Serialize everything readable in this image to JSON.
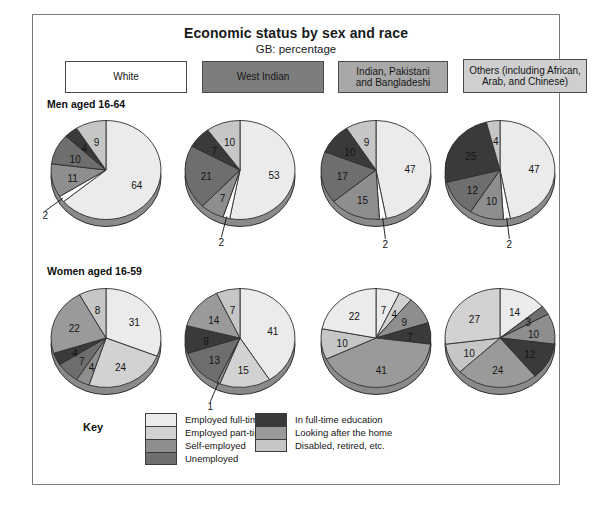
{
  "figure": {
    "title": "Economic status by sex and race",
    "subtitle": "GB: percentage",
    "row_labels": {
      "men": "Men aged 16-64",
      "women": "Women aged 16-59"
    },
    "key_title": "Key"
  },
  "groups": [
    {
      "id": "white",
      "line1": "White",
      "line2": "",
      "swatch": "#ffffff"
    },
    {
      "id": "west-indian",
      "line1": "West Indian",
      "line2": "",
      "swatch": "#7d7d7d"
    },
    {
      "id": "indian-pakistani-bangladeshi",
      "line1": "Indian, Pakistani",
      "line2": "and Bangladeshi",
      "swatch": "#a8a8a8"
    },
    {
      "id": "others",
      "line1": "Others (including African,",
      "line2": "Arab, and Chinese)",
      "swatch": "#cfcfcf"
    }
  ],
  "legend": {
    "left": [
      {
        "label": "Employed full-time",
        "color": "#ebebeb"
      },
      {
        "label": "Employed part-time",
        "color": "#d2d2d2"
      },
      {
        "label": "Self-employed",
        "color": "#8e8e8e"
      },
      {
        "label": "Unemployed",
        "color": "#6e6e6e"
      }
    ],
    "right": [
      {
        "label": "In full-time education",
        "color": "#3a3a3a"
      },
      {
        "label": "Looking after the home",
        "color": "#9a9a9a"
      },
      {
        "label": "Disabled, retired, etc.",
        "color": "#c6c6c6"
      }
    ]
  },
  "chart_data": {
    "type": "pie",
    "title": "Economic status by sex and race",
    "subtitle": "GB: percentage",
    "units": "percentage",
    "region": "GB",
    "categories": [
      "Employed full-time",
      "Employed part-time",
      "Self-employed",
      "Unemployed",
      "In full-time education",
      "Looking after the home",
      "Disabled, retired, etc."
    ],
    "category_colors": [
      "#ebebeb",
      "#d2d2d2",
      "#8e8e8e",
      "#6e6e6e",
      "#3a3a3a",
      "#9a9a9a",
      "#c6c6c6"
    ],
    "panels": [
      {
        "row": "Men aged 16-64",
        "group": "White",
        "slices": [
          {
            "label": "64",
            "value": 64,
            "category": "Employed full-time",
            "color": "#ebebeb"
          },
          {
            "label": "2",
            "value": 2,
            "category": "Employed part-time",
            "color": "#ffffff",
            "leader": true
          },
          {
            "label": "11",
            "value": 11,
            "category": "Self-employed",
            "color": "#8e8e8e"
          },
          {
            "label": "10",
            "value": 10,
            "category": "Unemployed",
            "color": "#6e6e6e"
          },
          {
            "label": "4",
            "value": 4,
            "category": "In full-time education",
            "color": "#3a3a3a"
          },
          {
            "label": "9",
            "value": 9,
            "category": "Disabled, retired, etc.",
            "color": "#c6c6c6"
          }
        ]
      },
      {
        "row": "Men aged 16-64",
        "group": "West Indian",
        "slices": [
          {
            "label": "53",
            "value": 53,
            "category": "Employed full-time",
            "color": "#ebebeb"
          },
          {
            "label": "2",
            "value": 2,
            "category": "Employed part-time",
            "color": "#ffffff",
            "leader": true
          },
          {
            "label": "7",
            "value": 7,
            "category": "Self-employed",
            "color": "#8e8e8e"
          },
          {
            "label": "21",
            "value": 21,
            "category": "Unemployed",
            "color": "#6e6e6e"
          },
          {
            "label": "7",
            "value": 7,
            "category": "In full-time education",
            "color": "#3a3a3a"
          },
          {
            "label": "10",
            "value": 10,
            "category": "Disabled, retired, etc.",
            "color": "#c6c6c6"
          }
        ]
      },
      {
        "row": "Men aged 16-64",
        "group": "Indian, Pakistani and Bangladeshi",
        "slices": [
          {
            "label": "47",
            "value": 47,
            "category": "Employed full-time",
            "color": "#ebebeb"
          },
          {
            "label": "2",
            "value": 2,
            "category": "Employed part-time",
            "color": "#ffffff",
            "leader": true
          },
          {
            "label": "15",
            "value": 15,
            "category": "Self-employed",
            "color": "#8e8e8e"
          },
          {
            "label": "17",
            "value": 17,
            "category": "Unemployed",
            "color": "#6e6e6e"
          },
          {
            "label": "10",
            "value": 10,
            "category": "In full-time education",
            "color": "#3a3a3a"
          },
          {
            "label": "9",
            "value": 9,
            "category": "Disabled, retired, etc.",
            "color": "#c6c6c6"
          }
        ]
      },
      {
        "row": "Men aged 16-64",
        "group": "Others (including African, Arab, and Chinese)",
        "slices": [
          {
            "label": "47",
            "value": 47,
            "category": "Employed full-time",
            "color": "#ebebeb"
          },
          {
            "label": "2",
            "value": 2,
            "category": "Employed part-time",
            "color": "#ffffff",
            "leader": true
          },
          {
            "label": "10",
            "value": 10,
            "category": "Self-employed",
            "color": "#8e8e8e"
          },
          {
            "label": "12",
            "value": 12,
            "category": "Unemployed",
            "color": "#6e6e6e"
          },
          {
            "label": "25",
            "value": 25,
            "category": "In full-time education",
            "color": "#3a3a3a"
          },
          {
            "label": "4",
            "value": 4,
            "category": "Disabled, retired, etc.",
            "color": "#c6c6c6"
          }
        ]
      },
      {
        "row": "Women aged 16-59",
        "group": "White",
        "slices": [
          {
            "label": "31",
            "value": 31,
            "category": "Employed full-time",
            "color": "#ebebeb"
          },
          {
            "label": "24",
            "value": 24,
            "category": "Employed part-time",
            "color": "#d2d2d2"
          },
          {
            "label": "4",
            "value": 4,
            "category": "Self-employed",
            "color": "#8e8e8e"
          },
          {
            "label": "7",
            "value": 7,
            "category": "Unemployed",
            "color": "#6e6e6e"
          },
          {
            "label": "4",
            "value": 4,
            "category": "In full-time education",
            "color": "#3a3a3a"
          },
          {
            "label": "22",
            "value": 22,
            "category": "Looking after the home",
            "color": "#9a9a9a"
          },
          {
            "label": "8",
            "value": 8,
            "category": "Disabled, retired, etc.",
            "color": "#c6c6c6"
          }
        ]
      },
      {
        "row": "Women aged 16-59",
        "group": "West Indian",
        "slices": [
          {
            "label": "41",
            "value": 41,
            "category": "Employed full-time",
            "color": "#ebebeb"
          },
          {
            "label": "15",
            "value": 15,
            "category": "Employed part-time",
            "color": "#d2d2d2"
          },
          {
            "label": "1",
            "value": 1,
            "category": "Self-employed",
            "color": "#8e8e8e",
            "leader": true
          },
          {
            "label": "13",
            "value": 13,
            "category": "Unemployed",
            "color": "#6e6e6e"
          },
          {
            "label": "9",
            "value": 9,
            "category": "In full-time education",
            "color": "#3a3a3a"
          },
          {
            "label": "14",
            "value": 14,
            "category": "Looking after the home",
            "color": "#9a9a9a"
          },
          {
            "label": "7",
            "value": 7,
            "category": "Disabled, retired, etc.",
            "color": "#c6c6c6"
          }
        ]
      },
      {
        "row": "Women aged 16-59",
        "group": "Indian, Pakistani and Bangladeshi",
        "slices": [
          {
            "label": "7",
            "value": 7,
            "category": "Employed full-time",
            "color": "#ebebeb"
          },
          {
            "label": "4",
            "value": 4,
            "category": "Employed part-time",
            "color": "#d2d2d2"
          },
          {
            "label": "9",
            "value": 9,
            "category": "Self-employed",
            "color": "#8e8e8e"
          },
          {
            "label": "7",
            "value": 7,
            "category": "Unemployed",
            "color": "#3a3a3a"
          },
          {
            "label": "41",
            "value": 41,
            "category": "Looking after the home",
            "color": "#9a9a9a"
          },
          {
            "label": "10",
            "value": 10,
            "category": "Disabled, retired, etc.",
            "color": "#c6c6c6"
          },
          {
            "label": "22",
            "value": 22,
            "category": "Employed full-time",
            "color": "#ebebeb"
          }
        ]
      },
      {
        "row": "Women aged 16-59",
        "group": "Others (including African, Arab, and Chinese)",
        "slices": [
          {
            "label": "14",
            "value": 14,
            "category": "Employed full-time",
            "color": "#ebebeb"
          },
          {
            "label": "3",
            "value": 3,
            "category": "Employed part-time",
            "color": "#6e6e6e"
          },
          {
            "label": "10",
            "value": 10,
            "category": "Self-employed",
            "color": "#8e8e8e"
          },
          {
            "label": "12",
            "value": 12,
            "category": "In full-time education",
            "color": "#3a3a3a"
          },
          {
            "label": "24",
            "value": 24,
            "category": "Looking after the home",
            "color": "#9a9a9a"
          },
          {
            "label": "10",
            "value": 10,
            "category": "Disabled, retired, etc.",
            "color": "#c6c6c6"
          },
          {
            "label": "27",
            "value": 27,
            "category": "Employed part-time",
            "color": "#d2d2d2"
          }
        ]
      }
    ]
  }
}
